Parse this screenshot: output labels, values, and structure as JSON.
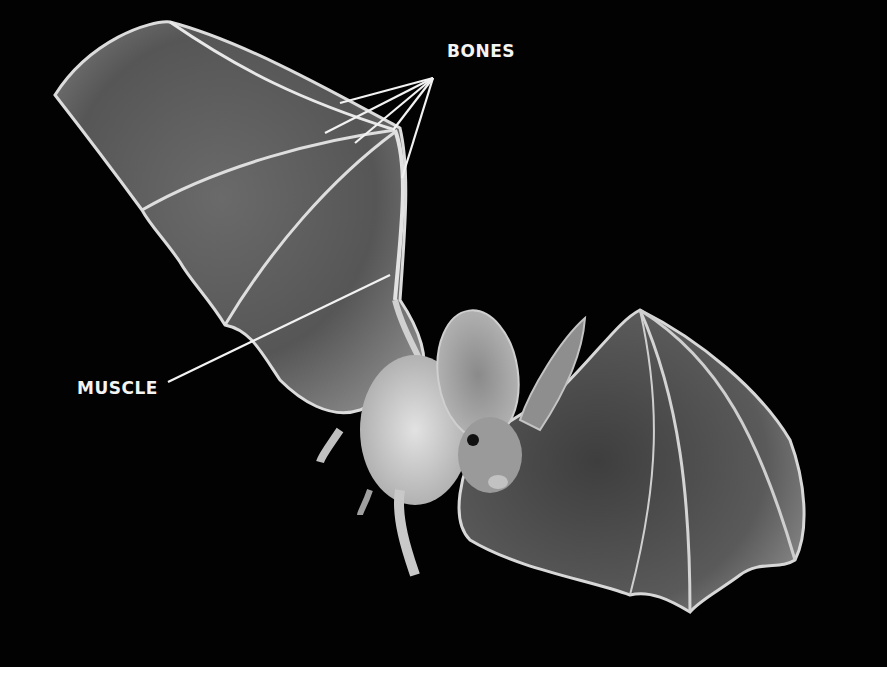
{
  "figure": {
    "background_color": "#020202",
    "labels": {
      "bones": "BONES",
      "muscle": "MUSCLE"
    }
  }
}
